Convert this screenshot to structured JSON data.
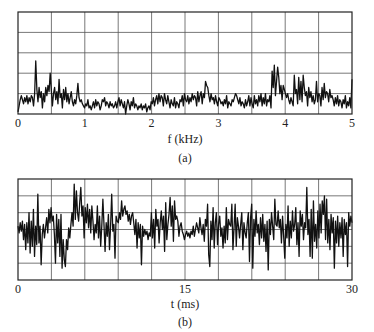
{
  "chart_data": [
    {
      "id": "a",
      "type": "line",
      "caption": "(a)",
      "xlabel": "f (kHz)",
      "ylabel": "",
      "xlim": [
        0,
        5
      ],
      "ylim": [
        0,
        5
      ],
      "xticks": [
        "0",
        "1",
        "2",
        "3",
        "4",
        "5"
      ],
      "grid": {
        "x_divisions": 10,
        "y_divisions": 5
      },
      "description": "Noisy magnitude spectrum; low background (~0.3-1.0 div) with peaks near 0.28 kHz, 0.48 kHz, 2.65 kHz, 3.6-3.7 kHz and 4.0-4.2 kHz",
      "x_step": 0.0166,
      "values": [
        0.1,
        0.4,
        0.7,
        0.9,
        0.7,
        0.5,
        0.8,
        0.6,
        0.9,
        0.5,
        0.8,
        0.6,
        0.9,
        0.8,
        0.4,
        1.0,
        2.6,
        1.2,
        0.6,
        1.3,
        0.8,
        1.1,
        0.3,
        1.0,
        0.6,
        1.3,
        0.9,
        1.4,
        1.1,
        2.0,
        1.2,
        0.4,
        1.0,
        1.3,
        0.7,
        1.1,
        0.5,
        1.7,
        0.8,
        1.0,
        0.3,
        1.2,
        0.7,
        1.3,
        0.6,
        1.0,
        0.5,
        0.8,
        1.1,
        0.6,
        0.4,
        0.7,
        0.5,
        0.9,
        1.5,
        0.8,
        0.6,
        0.7,
        0.5,
        0.4,
        0.3,
        0.5,
        0.4,
        0.7,
        0.3,
        0.4,
        0.2,
        0.4,
        0.6,
        0.3,
        0.7,
        0.4,
        0.6,
        0.5,
        0.2,
        0.4,
        0.7,
        0.6,
        0.8,
        0.4,
        0.6,
        0.5,
        0.3,
        0.6,
        0.4,
        0.5,
        0.3,
        0.4,
        0.6,
        0.3,
        0.6,
        0.8,
        0.4,
        0.7,
        0.5,
        0.3,
        0.6,
        0.0,
        0.4,
        0.7,
        0.5,
        0.2,
        0.6,
        0.4,
        0.8,
        0.3,
        0.5,
        0.4,
        0.2,
        0.4,
        0.3,
        0.5,
        0.2,
        0.4,
        0.3,
        0.5,
        0.1,
        0.3,
        0.4,
        0.2,
        0.6,
        0.5,
        0.8,
        0.4,
        0.7,
        0.9,
        0.5,
        1.0,
        0.6,
        0.9,
        0.8,
        0.4,
        1.0,
        0.7,
        0.5,
        0.9,
        0.6,
        0.3,
        0.7,
        0.5,
        0.4,
        0.8,
        0.3,
        0.6,
        0.5,
        0.3,
        0.7,
        0.6,
        0.9,
        0.4,
        1.0,
        0.7,
        0.6,
        0.9,
        0.5,
        0.8,
        0.6,
        1.0,
        0.7,
        0.9,
        0.8,
        0.4,
        1.1,
        0.6,
        0.9,
        1.1,
        0.5,
        1.0,
        0.8,
        1.6,
        1.4,
        1.3,
        0.9,
        0.6,
        1.0,
        0.7,
        0.8,
        0.5,
        0.9,
        0.6,
        0.4,
        0.8,
        0.7,
        0.5,
        0.6,
        0.4,
        0.7,
        0.5,
        0.9,
        0.3,
        0.6,
        0.5,
        0.4,
        0.7,
        0.6,
        0.8,
        1.0,
        0.9,
        0.7,
        0.5,
        0.8,
        0.4,
        0.6,
        0.5,
        0.3,
        0.7,
        0.4,
        0.6,
        0.9,
        0.4,
        0.8,
        0.5,
        0.3,
        0.9,
        0.5,
        0.7,
        0.4,
        0.9,
        0.6,
        1.0,
        0.4,
        0.8,
        0.5,
        1.0,
        0.4,
        0.7,
        0.6,
        0.9,
        0.3,
        2.1,
        1.3,
        2.4,
        0.9,
        1.6,
        2.3,
        1.8,
        1.0,
        1.4,
        0.7,
        1.4,
        1.2,
        1.0,
        0.8,
        1.0,
        0.7,
        0.5,
        0.8,
        0.6,
        0.4,
        1.9,
        1.0,
        1.2,
        0.5,
        1.8,
        0.7,
        1.6,
        0.6,
        1.9,
        1.3,
        0.9,
        1.1,
        0.4,
        1.3,
        0.8,
        1.1,
        0.6,
        0.9,
        0.5,
        0.7,
        1.6,
        0.6,
        1.0,
        0.9,
        0.4,
        1.3,
        0.7,
        1.5,
        0.8,
        1.1,
        1.0,
        0.6,
        1.2,
        0.8,
        0.9,
        0.7,
        0.4,
        0.8,
        0.5,
        0.9,
        0.4,
        0.7,
        0.6,
        0.3,
        0.7,
        0.5,
        0.9,
        0.3,
        0.6,
        0.4,
        0.8,
        0.3,
        1.7
      ]
    },
    {
      "id": "b",
      "type": "line",
      "caption": "(b)",
      "xlabel": "t (ms)",
      "ylabel": "",
      "xlim": [
        0,
        30
      ],
      "ylim": [
        -3,
        3
      ],
      "xticks": [
        "0",
        "15",
        "30"
      ],
      "grid": {
        "x_divisions": 10,
        "y_divisions": 6
      },
      "description": "Random noise waveform centered around zero spanning roughly -2.2 to +2.7 divisions over 30 ms",
      "x_step": 0.1,
      "values": [
        0.2,
        -0.2,
        0.4,
        -0.1,
        0.5,
        -0.6,
        0.3,
        -1.2,
        0.4,
        -0.8,
        1.0,
        -1.4,
        0.5,
        -1.0,
        1.2,
        -1.6,
        0.2,
        -0.9,
        2.1,
        -0.8,
        0.2,
        -2.1,
        -0.3,
        0.3,
        -0.5,
        0.1,
        0.7,
        -0.2,
        1.2,
        0.4,
        1.3,
        0.5,
        0.8,
        -0.3,
        -2.0,
        0.9,
        -0.8,
        0.6,
        -1.6,
        0.9,
        -2.3,
        -0.6,
        -1.8,
        -2.2,
        -0.6,
        -1.2,
        0.1,
        -0.5,
        0.3,
        1.0,
        0.2,
        2.7,
        0.6,
        2.3,
        1.0,
        0.5,
        1.6,
        2.5,
        0.8,
        1.4,
        -0.5,
        1.3,
        0.4,
        1.5,
        0.1,
        1.2,
        -0.2,
        1.4,
        0.5,
        -0.6,
        0.3,
        -0.2,
        1.4,
        -0.5,
        0.8,
        -1.0,
        0.2,
        1.8,
        0.3,
        -1.3,
        0.4,
        -0.4,
        0.9,
        -1.2,
        0.2,
        2.1,
        -0.1,
        0.3,
        -1.7,
        0.8,
        0.5,
        0.4,
        1.0,
        0.6,
        1.7,
        0.8,
        1.2,
        1.4,
        0.9,
        1.1,
        0.5,
        0.9,
        0.3,
        0.8,
        1.0,
        0.4,
        -0.3,
        0.6,
        -1.1,
        0.4,
        -0.5,
        0.3,
        -2.1,
        0.2,
        -0.4,
        0.0,
        -0.3,
        -0.1,
        -0.6,
        -0.2,
        -0.4,
        1.0,
        -0.5,
        0.6,
        -1.1,
        1.2,
        0.2,
        0.6,
        -0.8,
        0.4,
        1.1,
        0.0,
        0.8,
        -1.3,
        1.6,
        -0.6,
        0.3,
        0.9,
        1.9,
        0.2,
        1.4,
        -0.7,
        1.7,
        0.6,
        0.8,
        0.5,
        -0.4,
        0.2,
        0.4,
        -0.1,
        -0.3,
        -0.6,
        -0.3,
        -0.1,
        -0.4,
        -0.2,
        -0.5,
        -0.1,
        -0.3,
        0.2,
        -0.4,
        0.0,
        0.4,
        0.1,
        -0.2,
        0.7,
        0.1,
        -0.3,
        0.3,
        -0.7,
        0.6,
        0.2,
        1.5,
        -1.5,
        -2.2,
        0.5,
        -0.6,
        1.3,
        -1.1,
        0.4,
        1.0,
        -0.9,
        0.3,
        0.8,
        -0.4,
        0.1,
        -1.1,
        0.2,
        -0.8,
        1.3,
        -0.6,
        0.6,
        0.3,
        0.2,
        1.5,
        -1.2,
        0.1,
        1.5,
        -1.0,
        0.7,
        0.2,
        -0.5,
        0.3,
        1.0,
        -1.2,
        0.4,
        -0.2,
        -0.5,
        0.4,
        1.0,
        -1.9,
        0.7,
        1.5,
        -2.3,
        0.6,
        -0.4,
        1.1,
        -0.2,
        0.3,
        -0.9,
        0.7,
        -0.5,
        0.9,
        -0.7,
        0.3,
        -1.3,
        0.5,
        -2.4,
        0.6,
        -0.3,
        1.0,
        0.2,
        -0.6,
        1.8,
        0.3,
        0.2,
        1.1,
        0.1,
        0.6,
        -0.8,
        0.8,
        -0.4,
        -1.7,
        0.3,
        -0.5,
        1.4,
        -1.0,
        0.5,
        -0.5,
        1.1,
        -0.1,
        0.3,
        1.3,
        -0.9,
        0.4,
        -1.6,
        1.1,
        0.2,
        0.9,
        -0.6,
        0.4,
        0.1,
        2.5,
        -0.3,
        0.6,
        -1.6,
        1.2,
        -1.7,
        1.7,
        -0.7,
        0.3,
        -1.1,
        1.1,
        -0.5,
        1.5,
        -0.2,
        1.7,
        0.9,
        2.0,
        -0.6,
        1.8,
        -0.8,
        0.6,
        -1.2,
        0.9,
        -0.2,
        0.7,
        -2.3,
        0.5,
        -0.8,
        0.8,
        -1.0,
        0.4,
        -0.5,
        0.7,
        -1.6,
        0.6,
        -0.3,
        0.4,
        -2.2,
        1.0,
        0.2,
        0.8,
        0.4
      ]
    }
  ],
  "figure": {
    "line_color": "#111111",
    "grid_color": "#555555",
    "frame_color": "#222222"
  }
}
